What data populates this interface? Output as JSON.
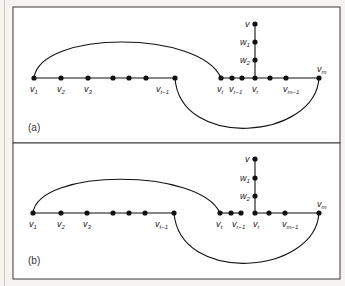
{
  "figure": {
    "panels": [
      {
        "id": "a",
        "label": "(a)",
        "nodes_main_left": [
          "v1",
          "v2",
          "v3",
          "",
          "",
          "",
          "v_{t-1}"
        ],
        "nodes_main_right": [
          "v_t",
          "v_{r-1}",
          "",
          "v_r",
          "",
          "v_{m-1}",
          "v_m"
        ],
        "vertical_nodes": [
          "v",
          "w1",
          "w2"
        ],
        "labels": {
          "v1": "v",
          "v1_sub": "1",
          "v2": "v",
          "v2_sub": "2",
          "v3": "v",
          "v3_sub": "3",
          "vt1": "v",
          "vt1_sub": "t−1",
          "vt": "v",
          "vt_sub": "t",
          "vr1": "v",
          "vr1_sub": "r−1",
          "vr": "v",
          "vr_sub": "r",
          "vm1": "v",
          "vm1_sub": "m−1",
          "vm": "v",
          "vm_sub": "m",
          "v": "v",
          "w1": "w",
          "w1_sub": "1",
          "w2": "w",
          "w2_sub": "2"
        },
        "edge_vr1_vr": true
      },
      {
        "id": "b",
        "label": "(b)",
        "labels": {
          "v1": "v",
          "v1_sub": "1",
          "v2": "v",
          "v2_sub": "2",
          "v3": "v",
          "v3_sub": "3",
          "vt1": "v",
          "vt1_sub": "t−1",
          "vt": "v",
          "vt_sub": "t",
          "vr1": "v",
          "vr1_sub": "r−1",
          "vr": "v",
          "vr_sub": "r",
          "vm1": "v",
          "vm1_sub": "m−1",
          "vm": "v",
          "vm_sub": "m",
          "v": "v",
          "w1": "w",
          "w1_sub": "1",
          "w2": "w",
          "w2_sub": "2"
        },
        "edge_vr1_vr": false
      }
    ]
  }
}
